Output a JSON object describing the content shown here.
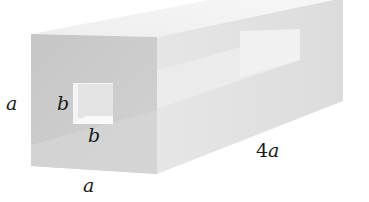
{
  "figure": {
    "type": "hollow rectangular bar with square through-hole",
    "colors": {
      "front_face": "#c9c9c9",
      "top_face": "#f0f0f0",
      "right_face": "#e3e3e3",
      "hole_inner": "#efefef",
      "inner_channel": "#ececec",
      "background": "#ffffff"
    },
    "labels": {
      "outer_height": "a",
      "outer_width": "a",
      "hole_height": "b",
      "hole_width": "b",
      "length_coefficient": "4",
      "length_variable": "a"
    }
  }
}
